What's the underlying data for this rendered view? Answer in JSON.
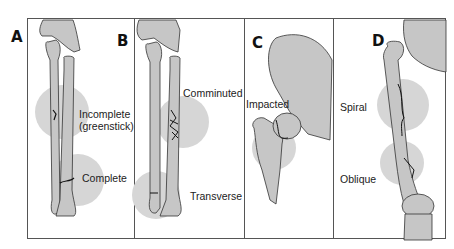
{
  "figure": {
    "panels": [
      {
        "letter": "A",
        "labels": [
          "Incomplete",
          "(greenstick)",
          "Complete"
        ]
      },
      {
        "letter": "B",
        "labels": [
          "Comminuted",
          "Transverse"
        ]
      },
      {
        "letter": "C",
        "labels": [
          "Impacted"
        ]
      },
      {
        "letter": "D",
        "labels": [
          "Spiral",
          "Oblique"
        ]
      }
    ]
  },
  "colors": {
    "bone_fill": "#c9c9c9",
    "bone_stroke": "#333333",
    "highlight_circle": "#d4d4d4",
    "frame": "#555555",
    "fracture_line": "#111111"
  }
}
